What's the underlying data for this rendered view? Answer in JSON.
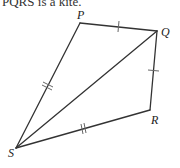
{
  "caption": "PQRS is a kite.",
  "diagram": {
    "vertices": {
      "P": {
        "label": "P",
        "x": 80,
        "y": 23
      },
      "Q": {
        "label": "Q",
        "x": 157,
        "y": 31
      },
      "R": {
        "label": "R",
        "x": 150,
        "y": 110
      },
      "S": {
        "label": "S",
        "x": 16,
        "y": 148
      }
    },
    "edges": [
      "PQ",
      "QR",
      "RS",
      "SP",
      "SQ"
    ],
    "tick_marks": {
      "PQ": 1,
      "QR": 1,
      "PS": 2,
      "SR": 2
    },
    "line_color": "#333333"
  }
}
